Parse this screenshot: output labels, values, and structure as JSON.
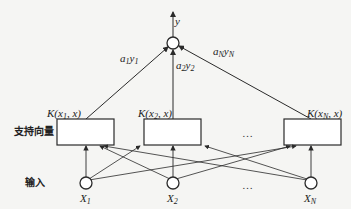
{
  "diagram": {
    "type": "svm-network",
    "output": {
      "label": "y"
    },
    "weights": [
      {
        "label_main": "a",
        "label_sub1": "1",
        "label_y": "y",
        "label_sub2": "1"
      },
      {
        "label_main": "a",
        "label_sub1": "2",
        "label_y": "y",
        "label_sub2": "2"
      },
      {
        "label_main": "a",
        "label_sub1": "N",
        "label_y": "y",
        "label_sub2": "N"
      }
    ],
    "kernels": [
      {
        "label": "K(x",
        "sub": "1",
        "tail": ", x)"
      },
      {
        "label": "K(x",
        "sub": "2",
        "tail": ", x)"
      },
      {
        "label": "K(x",
        "sub": "N",
        "tail": ", x)"
      }
    ],
    "row_labels": {
      "support_vectors": "支持向量",
      "input": "输入"
    },
    "ellipsis": "…",
    "inputs": [
      {
        "label": "X",
        "sub": "1"
      },
      {
        "label": "X",
        "sub": "2"
      },
      {
        "label": "X",
        "sub": "N"
      }
    ],
    "colors": {
      "line": "#2a2a2a",
      "background": "#f5f5f3"
    }
  }
}
